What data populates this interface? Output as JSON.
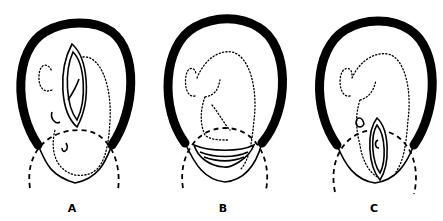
{
  "figure": {
    "panels": [
      {
        "id": "A",
        "label": "A",
        "incision": "vertical lens-shaped incision over upper uterine body"
      },
      {
        "id": "B",
        "label": "B",
        "incision": "transverse crescent incision in lower segment"
      },
      {
        "id": "C",
        "label": "C",
        "incision": "low vertical lens-shaped incision"
      }
    ],
    "colors": {
      "ink": "#000000",
      "background": "#ffffff"
    }
  }
}
